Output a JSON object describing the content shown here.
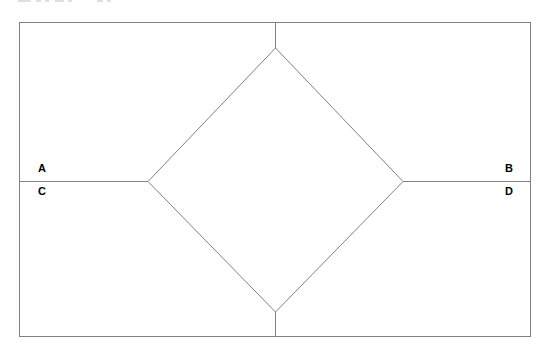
{
  "figure": {
    "background_color": "#ffffff",
    "line_color": "#808080",
    "label_color": "#000000",
    "canvas": {
      "width": 549,
      "height": 357
    },
    "rectangle": {
      "name": "outer-rectangle",
      "x": 19,
      "y": 22,
      "width": 512,
      "height": 315,
      "stroke": "#808080",
      "stroke_width": 1
    },
    "diamond": {
      "name": "inscribed-diamond",
      "top": {
        "x": 275,
        "y": 48
      },
      "right": {
        "x": 403,
        "y": 181
      },
      "bottom": {
        "x": 275,
        "y": 312
      },
      "left": {
        "x": 148,
        "y": 181
      },
      "stroke": "#808080",
      "stroke_width": 1
    },
    "horizontal_line": {
      "name": "horizontal-bisector",
      "x1": 19,
      "y1": 181,
      "x2": 531,
      "y2": 181,
      "left_segment": {
        "x1": 19,
        "x2": 148
      },
      "right_segment": {
        "x1": 403,
        "x2": 531
      }
    },
    "vertical_stubs": [
      {
        "name": "top-stub",
        "x": 275,
        "y1": 22,
        "y2": 48
      },
      {
        "name": "bottom-stub",
        "x": 275,
        "y1": 312,
        "y2": 337
      }
    ],
    "labels": [
      {
        "id": "A",
        "text": "A",
        "x": 38,
        "y": 168,
        "position": "left-above-line"
      },
      {
        "id": "C",
        "text": "C",
        "x": 38,
        "y": 191,
        "position": "left-below-line"
      },
      {
        "id": "B",
        "text": "B",
        "x": 509,
        "y": 168,
        "position": "right-above-line"
      },
      {
        "id": "D",
        "text": "D",
        "x": 509,
        "y": 191,
        "position": "right-below-line"
      }
    ]
  }
}
